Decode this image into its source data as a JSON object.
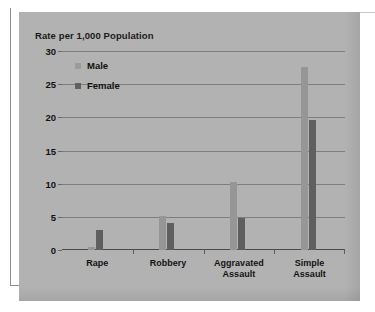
{
  "chart_data": {
    "type": "bar",
    "title": "Rate per 1,000 Population",
    "xlabel": "",
    "ylabel": "Rate per 1,000 Population",
    "categories": [
      "Rape",
      "Robbery",
      "Aggravated\nAssault",
      "Simple Assault"
    ],
    "series": [
      {
        "name": "Male",
        "color": "#969696",
        "values": [
          0.5,
          5.1,
          10.3,
          27.6
        ]
      },
      {
        "name": "Female",
        "color": "#5f5f5f",
        "values": [
          3.0,
          4.0,
          4.8,
          19.6
        ]
      }
    ],
    "ylim": [
      0,
      30
    ],
    "yticks": [
      0,
      5,
      10,
      15,
      20,
      25,
      30
    ],
    "ytick_labels": [
      "0",
      "5",
      "10",
      "15",
      "20",
      "25",
      "30"
    ],
    "grid": true,
    "legend_position": "top-left",
    "background_color": "#b2b2b2"
  },
  "legend": {
    "items": [
      {
        "label": "Male"
      },
      {
        "label": "Female"
      }
    ]
  }
}
